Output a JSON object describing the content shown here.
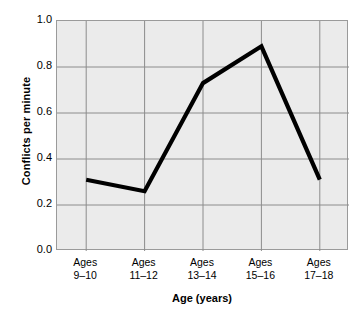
{
  "chart_data": {
    "type": "line",
    "title": "",
    "xlabel": "Age (years)",
    "ylabel": "Conflicts per minute",
    "categories": [
      "Ages 9–10",
      "Ages 11–12",
      "Ages 13–14",
      "Ages 15–16",
      "Ages 17–18"
    ],
    "category_lines": [
      {
        "line1": "Ages",
        "line2": "9–10"
      },
      {
        "line1": "Ages",
        "line2": "11–12"
      },
      {
        "line1": "Ages",
        "line2": "13–14"
      },
      {
        "line1": "Ages",
        "line2": "15–16"
      },
      {
        "line1": "Ages",
        "line2": "17–18"
      }
    ],
    "values": [
      0.31,
      0.26,
      0.73,
      0.89,
      0.31
    ],
    "ylim": [
      0.0,
      1.0
    ],
    "ytick_labels": [
      "1.0",
      "0.8",
      "0.6",
      "0.4",
      "0.2",
      "0.0"
    ],
    "ytick_values": [
      1.0,
      0.8,
      0.6,
      0.4,
      0.2,
      0.0
    ],
    "grid": true,
    "legend": "none",
    "series_color": "#000000",
    "plot_background": "#ebebeb",
    "gridline_color": "#8c8c8c",
    "axis_color": "#9a9a9a"
  }
}
